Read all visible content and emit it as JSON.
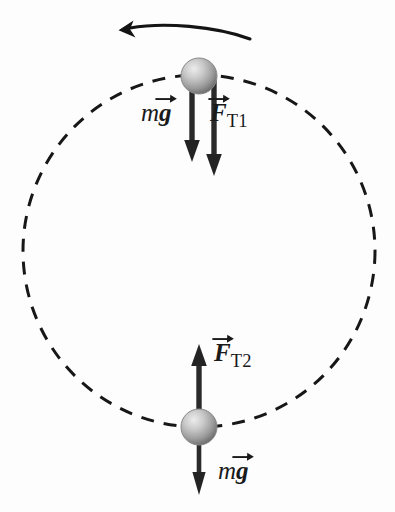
{
  "figure": {
    "background_color": "#fdfdfd",
    "ink_color": "#1a1a1a",
    "path": {
      "name": "circular-path",
      "style": "dashed",
      "center_x": 199,
      "center_y": 251,
      "radius": 176,
      "dash_length": 13,
      "dash_gap": 10,
      "stroke_width": 3,
      "color": "#171717"
    },
    "direction_arrow": {
      "name": "counterclockwise-motion-arrow",
      "description": "curved arrow above the circle pointing to the left",
      "direction": "counterclockwise",
      "start_x": 250,
      "start_y": 39,
      "end_x": 121,
      "end_y": 30
    },
    "balls": [
      {
        "name": "ball-top",
        "position": "top of circle",
        "cx": 199,
        "cy": 76,
        "r": 18,
        "fill_light": "#e8e8e8",
        "fill_dark": "#7d7d7d"
      },
      {
        "name": "ball-bottom",
        "position": "bottom of circle",
        "cx": 199,
        "cy": 427,
        "r": 18,
        "fill_light": "#e8e8e8",
        "fill_dark": "#7d7d7d"
      }
    ],
    "vectors": [
      {
        "name": "weight-vector-top",
        "symbol_prefix": "m",
        "symbol_vector": "g",
        "label_text": "mg",
        "direction": "down",
        "tail_x": 192,
        "tail_y": 80,
        "head_x": 192,
        "head_y": 158,
        "label_x": 141,
        "label_y": 100
      },
      {
        "name": "tension-vector-top",
        "symbol_vector": "F",
        "subscript": "T1",
        "label_text": "FT1",
        "direction": "down",
        "tail_x": 214,
        "tail_y": 80,
        "head_x": 214,
        "head_y": 175,
        "label_x": 210,
        "label_y": 100
      },
      {
        "name": "tension-vector-bottom",
        "symbol_vector": "F",
        "subscript": "T2",
        "label_text": "FT2",
        "direction": "up",
        "tail_x": 199,
        "tail_y": 424,
        "head_x": 199,
        "head_y": 344,
        "label_x": 214,
        "label_y": 340
      },
      {
        "name": "weight-vector-bottom",
        "symbol_prefix": "m",
        "symbol_vector": "g",
        "label_text": "mg",
        "direction": "down",
        "tail_x": 199,
        "tail_y": 430,
        "head_x": 199,
        "head_y": 495,
        "label_x": 218,
        "label_y": 458
      }
    ]
  }
}
